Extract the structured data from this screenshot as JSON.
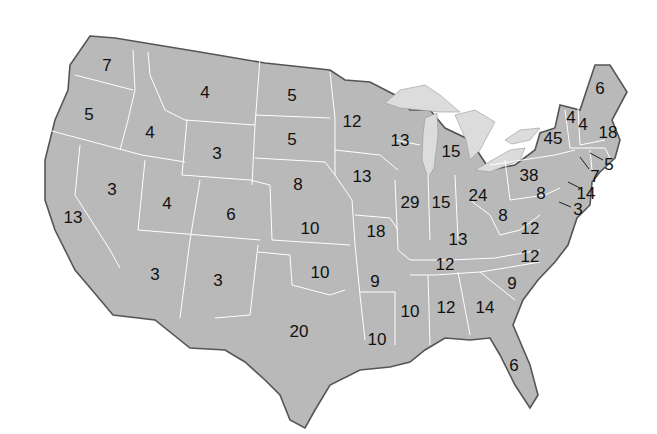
{
  "map": {
    "title": "",
    "colors": {
      "land": "#b9b9b9",
      "lake": "#dcdcdc",
      "border_internal": "#ffffff",
      "border_external": "#555555",
      "text": "#111111"
    },
    "states": [
      {
        "id": "WA",
        "value": "7",
        "x": 107,
        "y": 65
      },
      {
        "id": "OR",
        "value": "5",
        "x": 89,
        "y": 114
      },
      {
        "id": "ID",
        "value": "4",
        "x": 150,
        "y": 132
      },
      {
        "id": "MT",
        "value": "4",
        "x": 205,
        "y": 92
      },
      {
        "id": "WY",
        "value": "3",
        "x": 217,
        "y": 153
      },
      {
        "id": "ND",
        "value": "5",
        "x": 292,
        "y": 95
      },
      {
        "id": "SD",
        "value": "5",
        "x": 292,
        "y": 139
      },
      {
        "id": "NE",
        "value": "8",
        "x": 298,
        "y": 184
      },
      {
        "id": "NV",
        "value": "3",
        "x": 112,
        "y": 189
      },
      {
        "id": "UT",
        "value": "4",
        "x": 167,
        "y": 203
      },
      {
        "id": "CO",
        "value": "6",
        "x": 231,
        "y": 214
      },
      {
        "id": "CA",
        "value": "13",
        "x": 73,
        "y": 217
      },
      {
        "id": "KS",
        "value": "10",
        "x": 310,
        "y": 228
      },
      {
        "id": "AZ",
        "value": "3",
        "x": 155,
        "y": 274
      },
      {
        "id": "NM",
        "value": "3",
        "x": 218,
        "y": 280
      },
      {
        "id": "OK",
        "value": "10",
        "x": 320,
        "y": 272
      },
      {
        "id": "TX",
        "value": "20",
        "x": 299,
        "y": 331
      },
      {
        "id": "MN",
        "value": "12",
        "x": 352,
        "y": 121
      },
      {
        "id": "IA",
        "value": "13",
        "x": 362,
        "y": 176
      },
      {
        "id": "MO",
        "value": "18",
        "x": 376,
        "y": 231
      },
      {
        "id": "AR",
        "value": "9",
        "x": 375,
        "y": 281
      },
      {
        "id": "LA",
        "value": "10",
        "x": 377,
        "y": 339
      },
      {
        "id": "WI",
        "value": "13",
        "x": 400,
        "y": 140
      },
      {
        "id": "IL",
        "value": "29",
        "x": 410,
        "y": 202
      },
      {
        "id": "MI",
        "value": "15",
        "x": 451,
        "y": 151
      },
      {
        "id": "IN",
        "value": "15",
        "x": 441,
        "y": 202
      },
      {
        "id": "OH",
        "value": "24",
        "x": 478,
        "y": 195
      },
      {
        "id": "KY",
        "value": "13",
        "x": 458,
        "y": 239
      },
      {
        "id": "TN",
        "value": "12",
        "x": 445,
        "y": 264
      },
      {
        "id": "MS",
        "value": "10",
        "x": 410,
        "y": 311
      },
      {
        "id": "AL",
        "value": "12",
        "x": 446,
        "y": 307
      },
      {
        "id": "GA",
        "value": "14",
        "x": 485,
        "y": 307
      },
      {
        "id": "FL",
        "value": "6",
        "x": 514,
        "y": 365
      },
      {
        "id": "SC",
        "value": "9",
        "x": 512,
        "y": 283
      },
      {
        "id": "NC",
        "value": "12",
        "x": 530,
        "y": 256
      },
      {
        "id": "VA",
        "value": "12",
        "x": 530,
        "y": 228
      },
      {
        "id": "WV",
        "value": "8",
        "x": 503,
        "y": 215
      },
      {
        "id": "PA",
        "value": "38",
        "x": 529,
        "y": 175
      },
      {
        "id": "MD",
        "value": "8",
        "x": 541,
        "y": 193
      },
      {
        "id": "DE",
        "value": "3",
        "x": 578,
        "y": 209
      },
      {
        "id": "NJ",
        "value": "14",
        "x": 586,
        "y": 193
      },
      {
        "id": "NY",
        "value": "45",
        "x": 553,
        "y": 138
      },
      {
        "id": "VT",
        "value": "4",
        "x": 571,
        "y": 117
      },
      {
        "id": "NH",
        "value": "4",
        "x": 583,
        "y": 124
      },
      {
        "id": "ME",
        "value": "6",
        "x": 600,
        "y": 88
      },
      {
        "id": "MA",
        "value": "18",
        "x": 608,
        "y": 132
      },
      {
        "id": "RI",
        "value": "5",
        "x": 609,
        "y": 164
      },
      {
        "id": "CT",
        "value": "7",
        "x": 595,
        "y": 176
      }
    ]
  }
}
